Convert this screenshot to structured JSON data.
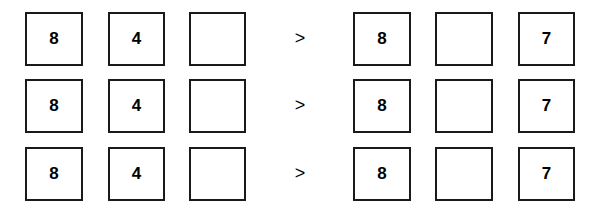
{
  "rows": [
    {
      "left": [
        "8",
        "4",
        ""
      ],
      "operator": ">",
      "right": [
        "8",
        "",
        "7"
      ]
    },
    {
      "left": [
        "8",
        "4",
        ""
      ],
      "operator": ">",
      "right": [
        "8",
        "",
        "7"
      ]
    },
    {
      "left": [
        "8",
        "4",
        ""
      ],
      "operator": ">",
      "right": [
        "8",
        "",
        "7"
      ]
    }
  ]
}
